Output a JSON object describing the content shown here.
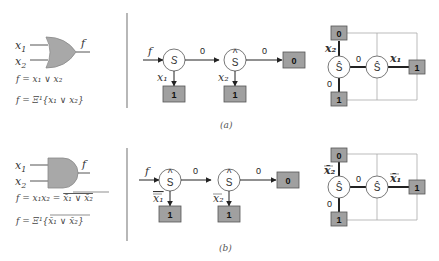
{
  "colors": {
    "gate_fill": "#a8a8a8",
    "box_fill": "#a0a0a0",
    "line": "#222222",
    "thin_line": "#aaaaaa",
    "divider": "#888888"
  },
  "panels": [
    {
      "caption": "(a)",
      "gate": {
        "type": "OR",
        "inputs": [
          "x1",
          "x2"
        ],
        "output": "f",
        "equation1": "f = x₁ ∨ x₂",
        "equation2": "f = Ξ¹{x₁ ∨ x₂}"
      },
      "chain": {
        "input_label": "f",
        "nodes": [
          {
            "symbol": "Ŝ",
            "side_label": "x₁",
            "leaf": "1"
          },
          {
            "symbol": "Ŝ",
            "side_label": "x₂",
            "leaf": "1"
          }
        ],
        "edge_labels": [
          "0",
          "0"
        ],
        "terminal": "0"
      },
      "grid": {
        "top_box": "0",
        "bottom_box": "1",
        "right_box": "1",
        "left_node": "Ŝ",
        "center_node": "Ŝ",
        "label_up": "x₂",
        "label_down": "0",
        "label_mid": "0",
        "label_right": "x₁"
      }
    },
    {
      "caption": "(b)",
      "gate": {
        "type": "AND",
        "inputs": [
          "x1",
          "x2"
        ],
        "output": "f",
        "equation1": "f = x₁x₂ = x̄₁ ∨ x̄₂ (overlined)",
        "equation1_lhs": "f = x₁x₂ = ",
        "equation1_rhs": "x̄₁ ∨ x̄₂",
        "equation2_lhs": "f = Ξ¹{",
        "equation2_rhs": "x̄₁ ∨ x̄₂",
        "equation2_end": "}"
      },
      "chain": {
        "input_label": "f",
        "nodes": [
          {
            "symbol": "Ŝ",
            "side_label": "x̄₁",
            "leaf": "1"
          },
          {
            "symbol": "Ŝ",
            "side_label": "x̄₂",
            "leaf": "1"
          }
        ],
        "edge_labels": [
          "0",
          "0"
        ],
        "terminal": "0"
      },
      "grid": {
        "top_box": "0",
        "bottom_box": "1",
        "right_box": "1",
        "left_node": "Ŝ",
        "center_node": "Ŝ",
        "label_up": "x̄₂",
        "label_down": "0",
        "label_mid": "0",
        "label_right": "x̄₁"
      }
    }
  ],
  "text": {
    "x1": "x",
    "x1_sub": "1",
    "x2": "x",
    "x2_sub": "2",
    "f": "f",
    "eq_a1": "f = x₁ ∨ x₂",
    "eq_a2": "f = Ξ¹{x₁ ∨ x₂}",
    "eq_b1_lhs": "f = x₁x₂ = ",
    "eq_b1_rhs": "x̄₁ ∨ x̄₂",
    "eq_b2_lhs": "f = Ξ¹{",
    "eq_b2_rhs": "x̄₁ ∨ x̄₂",
    "eq_b2_end": "}",
    "S_hat": "Ŝ",
    "S_plain": "S",
    "hat": "^",
    "zero": "0",
    "one": "1",
    "cap_a": "(a)",
    "cap_b": "(b)",
    "x1_label": "x₁",
    "x2_label": "x₂",
    "x1bar_label": "x̄₁",
    "x2bar_label": "x̄₂"
  }
}
